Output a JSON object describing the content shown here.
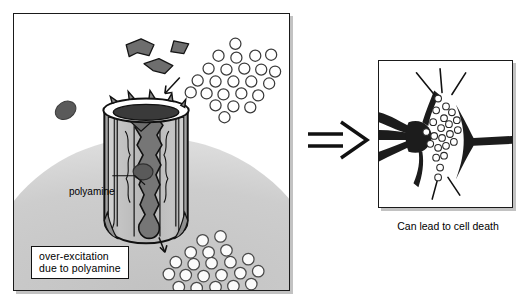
{
  "figure": {
    "background_color": "#ffffff"
  },
  "left_panel": {
    "name": "ion-channel-membrane-panel",
    "border_color": "#1a1a1a",
    "membrane_color": "#c9c9c9",
    "caption_box": {
      "line1": "over-excitation",
      "line2": "due to polyamine"
    },
    "leader_label": "polyamine",
    "channel": {
      "name": "ion-channel",
      "body_color": "#b4b4b4",
      "pore_color": "#6e6e6e",
      "rim_color": "#ffffff",
      "outline_color": "#111111"
    },
    "polyamine_blob": {
      "name": "polyamine-molecule",
      "color": "#5a5a5a"
    },
    "glutamate_shapes": {
      "name": "glutamate-molecules",
      "color": "#6b6b6b",
      "count": 3
    },
    "extracellular_ions": {
      "name": "extracellular-ion-cluster",
      "fill": "#ffffff",
      "stroke": "#3a3a3a",
      "count": 24
    },
    "intracellular_ions": {
      "name": "intracellular-ion-cluster",
      "fill": "#fbfbfb",
      "stroke": "#4a4a4a",
      "count": 22
    },
    "influx_arrow": "ion-influx-arrow",
    "efflux_arrow": "ion-efflux-arrow"
  },
  "implication": {
    "name": "double-line-implies-arrow",
    "glyph": "⇒",
    "color": "#111111"
  },
  "right_panel": {
    "name": "neuron-panel",
    "border_color": "#1a1a1a",
    "neuron_color": "#1c1c1c",
    "ion_fill": "#ffffff",
    "ion_stroke": "#2a2a2a",
    "burst_line_color": "#111111",
    "caption": "Can lead to cell death"
  }
}
